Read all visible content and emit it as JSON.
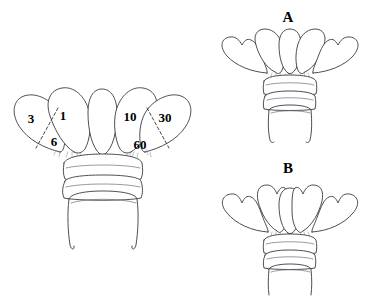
{
  "figure": {
    "background_color": "#ffffff",
    "line_color": "#3a3a42",
    "label_color": "#000000",
    "width": 366,
    "height": 296
  },
  "main_panel": {
    "name": "labelled-antennal-club",
    "segment_labels": [
      {
        "id": "lamella-3",
        "text": "3",
        "x": 31,
        "y": 120
      },
      {
        "id": "lamella-6",
        "text": "6",
        "x": 54,
        "y": 143
      },
      {
        "id": "lamella-1",
        "text": "1",
        "x": 63,
        "y": 117
      },
      {
        "id": "lamella-10",
        "text": "10",
        "x": 130,
        "y": 118
      },
      {
        "id": "lamella-60",
        "text": "60",
        "x": 140,
        "y": 146
      },
      {
        "id": "lamella-30",
        "text": "30",
        "x": 165,
        "y": 119
      }
    ],
    "dashed_dividers": 2,
    "lamellae_count": 5,
    "basal_ring_count": 2
  },
  "panel_a": {
    "name": "panel-a",
    "label": "A",
    "label_x": 288,
    "label_y": 22,
    "lamellae_count": 5,
    "basal_ring_count": 2,
    "outer_lamella_tip": "notched"
  },
  "panel_b": {
    "name": "panel-b",
    "label": "B",
    "label_x": 288,
    "label_y": 173,
    "lamellae_count": 5,
    "basal_ring_count": 2,
    "outer_lamella_tip": "notched"
  }
}
